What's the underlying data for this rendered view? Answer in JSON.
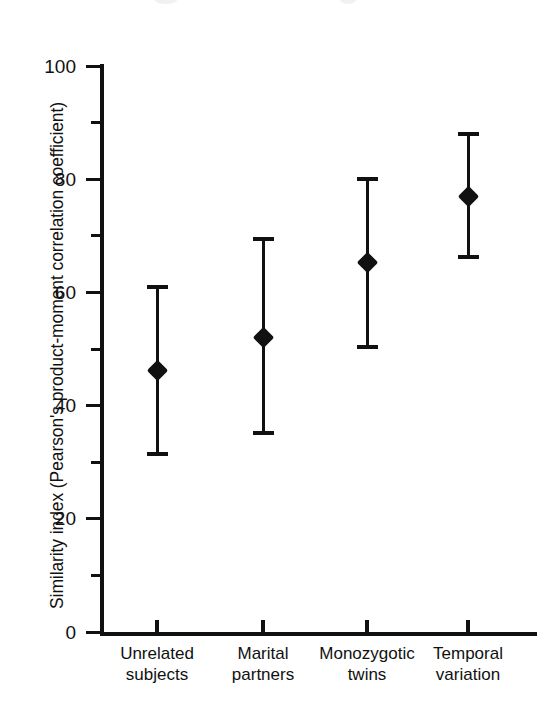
{
  "figure": {
    "background_color": "#ffffff",
    "ink_color": "#111111"
  },
  "chart_data": {
    "type": "scatter",
    "title": "",
    "subtitle": "",
    "xlabel": "",
    "ylabel": "Similarity index (Pearson's product-moment correlation coefficient)",
    "ylim": [
      0,
      100
    ],
    "y_major_ticks": [
      0,
      20,
      40,
      60,
      80,
      100
    ],
    "y_minor_ticks": [
      10,
      30,
      50,
      70,
      90
    ],
    "y_tick_labels": [
      "0",
      "20",
      "40",
      "60",
      "80",
      "100"
    ],
    "grid": false,
    "legend": false,
    "legend_position": "none",
    "error_bar_style": "capped-vertical",
    "marker_style": "filled-diamond",
    "categories": [
      "Unrelated subjects",
      "Marital partners",
      "Monozygotic twins",
      "Temporal variation"
    ],
    "category_lines": [
      [
        "Unrelated",
        "subjects"
      ],
      [
        "Marital",
        "partners"
      ],
      [
        "Monozygotic",
        "twins"
      ],
      [
        "Temporal",
        "variation"
      ]
    ],
    "values": [
      46.4,
      52.2,
      65.5,
      77.2
    ],
    "error_upper": [
      61.4,
      69.9,
      80.5,
      88.5
    ],
    "error_lower": [
      31.3,
      35.0,
      50.3,
      66.2
    ],
    "points": [
      {
        "category": "Unrelated subjects",
        "value": 46.4,
        "upper": 61.4,
        "lower": 31.3
      },
      {
        "category": "Marital partners",
        "value": 52.2,
        "upper": 69.9,
        "lower": 35.0
      },
      {
        "category": "Monozygotic twins",
        "value": 65.5,
        "upper": 80.5,
        "lower": 50.3
      },
      {
        "category": "Temporal variation",
        "value": 77.2,
        "upper": 88.5,
        "lower": 66.2
      }
    ]
  },
  "geometry": {
    "y_zero_px": 632,
    "y_hundred_px": 67,
    "x_positions_px": [
      157,
      263,
      367,
      468
    ]
  }
}
